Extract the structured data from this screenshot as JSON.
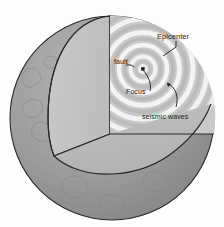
{
  "diagram": {
    "labels": {
      "epicenter": "Epicenter",
      "fault": "fault",
      "focus": "Focus",
      "seismic_waves": "seismic waves"
    },
    "colors": {
      "background": "#fdfdfd",
      "outer_shell": "#9c9c9c",
      "outer_shell_dark": "#8e8e8e",
      "cut_face_vertical": "#c4c4c4",
      "cut_face_horizontal": "#bdbdbd",
      "wave_light": "#f2f2f2",
      "wave_dark": "#b9b9b9",
      "outline": "#2a2a2a",
      "label_text": "#1b1b1b",
      "continent_line": "#8a8a8a"
    },
    "geometry": {
      "sphere_center_x": 112,
      "sphere_center_y": 118,
      "sphere_radius": 102,
      "focus_point_x": 143,
      "focus_point_y": 69,
      "wedge_apex_x": 110,
      "wedge_apex_y": 16
    }
  }
}
